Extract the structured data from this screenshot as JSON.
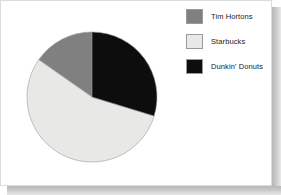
{
  "chart_data": {
    "type": "pie",
    "title": "",
    "subtitle": "",
    "xlabel": "",
    "ylabel": "",
    "legend_position": "right",
    "grid": false,
    "start_angle_deg": 0,
    "direction": "clockwise",
    "categories": [
      "Tim Hortons",
      "Starbucks",
      "Dunkin' Donuts"
    ],
    "values": [
      15,
      55,
      30
    ],
    "colors": [
      "#808080",
      "#e8e8e6",
      "#0d0d0d"
    ],
    "slices": [
      {
        "label": "Tim Hortons",
        "value": 15,
        "color": "#808080",
        "start_angle_deg": 305,
        "end_angle_deg": 360,
        "sweep_deg": 55
      },
      {
        "label": "Starbucks",
        "value": 55,
        "color": "#e8e8e6",
        "start_angle_deg": 107,
        "end_angle_deg": 305,
        "sweep_deg": 198
      },
      {
        "label": "Dunkin' Donuts",
        "value": 30,
        "color": "#0d0d0d",
        "start_angle_deg": 0,
        "end_angle_deg": 107,
        "sweep_deg": 107
      }
    ]
  },
  "legend": {
    "items": [
      {
        "label": "Tim Hortons",
        "color": "#808080"
      },
      {
        "label": "Starbucks",
        "color": "#e8e8e6"
      },
      {
        "label": "Dunkin' Donuts",
        "color": "#0d0d0d"
      }
    ]
  },
  "style": {
    "panel_background": "#ffffff",
    "panel_border": "#dcdcdc",
    "shadow_color": "#b7b7b7",
    "slice_outline": "#9a9a9a",
    "text_color": "#1a1a1a"
  }
}
